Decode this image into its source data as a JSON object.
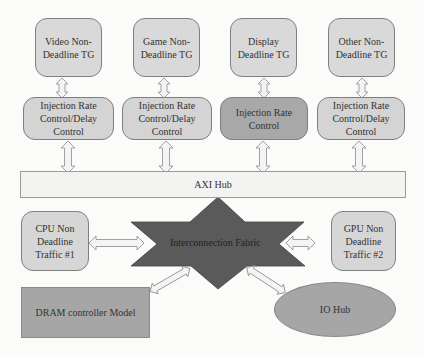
{
  "diagram": {
    "traffic_generators": [
      {
        "label_line1": "Video Non-",
        "label_line2": "Deadline TG"
      },
      {
        "label_line1": "Game Non-",
        "label_line2": "Deadline TG"
      },
      {
        "label_line1": "Display",
        "label_line2": "Deadline TG"
      },
      {
        "label_line1": "Other Non-",
        "label_line2": "Deadline TG"
      }
    ],
    "controls": [
      {
        "label_line1": "Injection Rate",
        "label_line2": "Control/Delay",
        "label_line3": "Control"
      },
      {
        "label_line1": "Injection Rate",
        "label_line2": "Control/Delay",
        "label_line3": "Control"
      },
      {
        "label_line1": "Injection Rate",
        "label_line2": "Control",
        "label_line3": ""
      },
      {
        "label_line1": "Injection Rate",
        "label_line2": "Control/Delay",
        "label_line3": "Control"
      }
    ],
    "axi_hub": {
      "label": "AXI Hub"
    },
    "interconnect": {
      "label": "Interconnection Fabric"
    },
    "cpu": {
      "label_line1": "CPU Non",
      "label_line2": "Deadline",
      "label_line3": "Traffic #1"
    },
    "gpu": {
      "label_line1": "GPU Non",
      "label_line2": "Deadline",
      "label_line3": "Traffic #2"
    },
    "dram": {
      "label": "DRAM controller Model"
    },
    "io_hub": {
      "label": "IO Hub"
    },
    "colors": {
      "light_fill": "#d9d9d9",
      "dark_control_fill": "#a8a8a8",
      "star_fill": "#595959",
      "arrow_fill": "#f2f2f2",
      "arrow_stroke": "#8c8c8c"
    }
  }
}
